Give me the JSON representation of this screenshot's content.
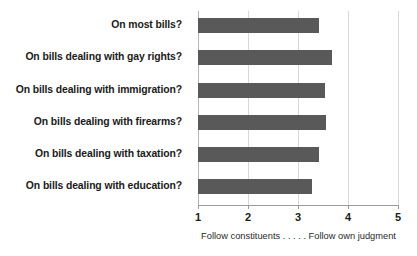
{
  "chart_data": {
    "type": "bar",
    "orientation": "horizontal",
    "title": "",
    "xlabel": "Follow constituents . . . . . Follow own judgment",
    "ylabel": "",
    "xlim": [
      1,
      5
    ],
    "xticks": [
      "1",
      "2",
      "3",
      "4",
      "5"
    ],
    "grid": true,
    "legend": "none",
    "bar_color": "#595959",
    "gridline_color": "#d8d8d8",
    "axis_color": "#9a9a9a",
    "categories": [
      "On most bills?",
      "On bills dealing with gay rights?",
      "On bills dealing with immigration?",
      "On bills dealing with firearms?",
      "On bills dealing with taxation?",
      "On bills dealing with education?"
    ],
    "values": [
      3.42,
      3.68,
      3.54,
      3.56,
      3.42,
      3.28
    ],
    "caption_left": "Follow constituents",
    "caption_dots": " . . . . . ",
    "caption_right": "Follow own judgment"
  }
}
